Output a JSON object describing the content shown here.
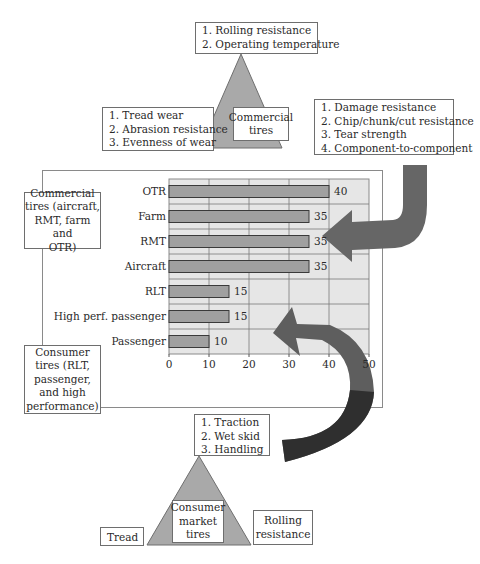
{
  "commercial": {
    "triangle_label": [
      "Commercial",
      "tires"
    ],
    "top_box": [
      "1. Rolling resistance",
      "2. Operating temperature"
    ],
    "left_box": [
      "1. Tread wear",
      "2. Abrasion resistance",
      "3. Evenness of wear"
    ],
    "right_box": [
      "1. Damage resistance",
      "2. Chip/chunk/cut resistance",
      "3. Tear strength",
      "4. Component-to-component"
    ]
  },
  "side_labels": {
    "commercial_group": [
      "Commercial",
      "tires (aircraft,",
      "RMT, farm and",
      "OTR)"
    ],
    "consumer_group": [
      "Consumer",
      "tires (RLT,",
      "passenger,",
      "and high",
      "performance)"
    ]
  },
  "consumer": {
    "triangle_label": [
      "Consumer",
      "market",
      "tires"
    ],
    "top_box": [
      "1. Traction",
      "2. Wet skid",
      "3. Handling"
    ],
    "left_box": [
      "Tread"
    ],
    "right_box": [
      "Rolling",
      "resistance"
    ]
  },
  "colors": {
    "triangle_fill": "#a9a9a9",
    "bar_fill": "#a0a0a0",
    "plot_bg": "#e6e6e6",
    "grid": "#7a7a7a",
    "arrow_top": "#6a6a6a",
    "arrow_bottom_light": "#6e6e6e",
    "arrow_bottom_dark": "#333333"
  },
  "chart_data": {
    "type": "bar",
    "orientation": "horizontal",
    "categories": [
      "OTR",
      "Farm",
      "RMT",
      "Aircraft",
      "RLT",
      "High perf. passenger",
      "Passenger"
    ],
    "values": [
      40,
      35,
      35,
      35,
      15,
      15,
      10
    ],
    "value_labels": [
      "40",
      "35",
      "35",
      "35",
      "15",
      "15",
      "10"
    ],
    "title": "",
    "xlabel": "",
    "ylabel": "",
    "xlim": [
      0,
      50
    ],
    "xticks": [
      "0",
      "10",
      "20",
      "30",
      "40",
      "50"
    ],
    "grid": true,
    "legend": "none"
  }
}
